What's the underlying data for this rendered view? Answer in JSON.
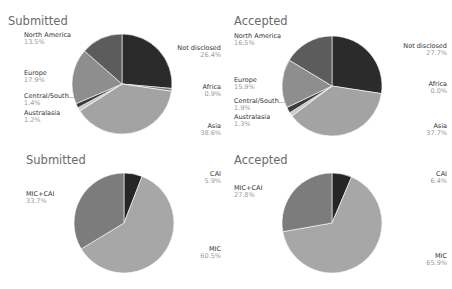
{
  "chart_data": [
    {
      "type": "pie",
      "title": "Submitted",
      "categories": [
        "Not disclosed",
        "Africa",
        "Asia",
        "Australasia",
        "Central/South...",
        "Europe",
        "North America"
      ],
      "values": [
        26.4,
        0.9,
        38.6,
        1.2,
        1.4,
        17.9,
        13.5
      ],
      "labels": [
        "26.4%",
        "0.9%",
        "38.6%",
        "1.2%",
        "1.4%",
        "17.9%",
        "13.5%"
      ]
    },
    {
      "type": "pie",
      "title": "Accepted",
      "categories": [
        "Not disclosed",
        "Africa",
        "Asia",
        "Australasia",
        "Central/South...",
        "Europe",
        "North America"
      ],
      "values": [
        27.7,
        0.0,
        37.7,
        1.3,
        1.9,
        15.9,
        16.5
      ],
      "labels": [
        "27.7%",
        "0.0%",
        "37.7%",
        "1.3%",
        "1.9%",
        "15.9%",
        "16.5%"
      ]
    },
    {
      "type": "pie",
      "title": "Submitted",
      "categories": [
        "CAI",
        "MIC",
        "MIC+CAI"
      ],
      "values": [
        5.9,
        60.5,
        33.7
      ],
      "labels": [
        "5.9%",
        "60.5%",
        "33.7%"
      ]
    },
    {
      "type": "pie",
      "title": "Accepted",
      "categories": [
        "CAI",
        "MIC",
        "MIC+CAI"
      ],
      "values": [
        6.4,
        65.9,
        27.8
      ],
      "labels": [
        "6.4%",
        "65.9%",
        "27.8%"
      ]
    }
  ],
  "colors": {
    "Not disclosed": "#2b2b2b",
    "Africa": "#7a7a7a",
    "Asia": "#a3a3a3",
    "Australasia": "#c9c9c9",
    "Central/South...": "#3c3c3c",
    "Europe": "#8e8e8e",
    "North America": "#5c5c5c",
    "CAI": "#262626",
    "MIC": "#a7a7a7",
    "MIC+CAI": "#7c7c7c"
  }
}
